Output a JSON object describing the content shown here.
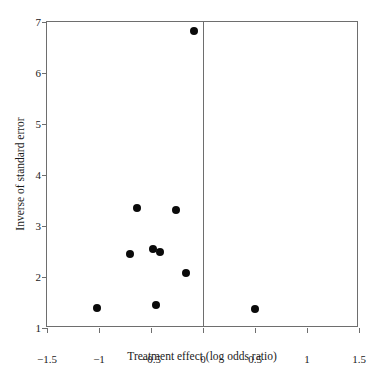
{
  "chart_data": {
    "type": "scatter",
    "title": "",
    "subtitle": "",
    "xlabel": "Treatment effect (log odds ratio)",
    "ylabel": "Inverse of standard error",
    "xlim": [
      -1.5,
      1.5
    ],
    "ylim": [
      1,
      7
    ],
    "xticks": [
      -1.5,
      -1,
      -0.5,
      0,
      0.5,
      1,
      1.5
    ],
    "yticks": [
      1,
      2,
      3,
      4,
      5,
      6,
      7
    ],
    "xticklabels": [
      "−1.5",
      "−1",
      "−0.5",
      "0",
      "0.5",
      "1",
      "1.5"
    ],
    "yticklabels": [
      "1",
      "2",
      "3",
      "4",
      "5",
      "6",
      "7"
    ],
    "grid": false,
    "legend": null,
    "legend_position": "none",
    "marker": {
      "shape": "circle",
      "color": "#0a0a0a",
      "size_px": 8
    },
    "reference_lines": [
      {
        "orientation": "vertical",
        "x": 0,
        "color": "#6e6e6e",
        "style": "solid"
      }
    ],
    "points": [
      {
        "x": -0.09,
        "y": 6.82
      },
      {
        "x": -0.63,
        "y": 3.35
      },
      {
        "x": -0.26,
        "y": 3.31
      },
      {
        "x": -0.48,
        "y": 2.55
      },
      {
        "x": -0.41,
        "y": 2.5
      },
      {
        "x": -0.7,
        "y": 2.45
      },
      {
        "x": -0.16,
        "y": 2.07
      },
      {
        "x": -0.45,
        "y": 1.45
      },
      {
        "x": -1.02,
        "y": 1.39
      },
      {
        "x": 0.5,
        "y": 1.37
      }
    ],
    "n_points": 10
  },
  "figure": {
    "background_color": "#ffffff",
    "frame_color": "#6e6e6e",
    "text_color": "#1a1a1a"
  }
}
